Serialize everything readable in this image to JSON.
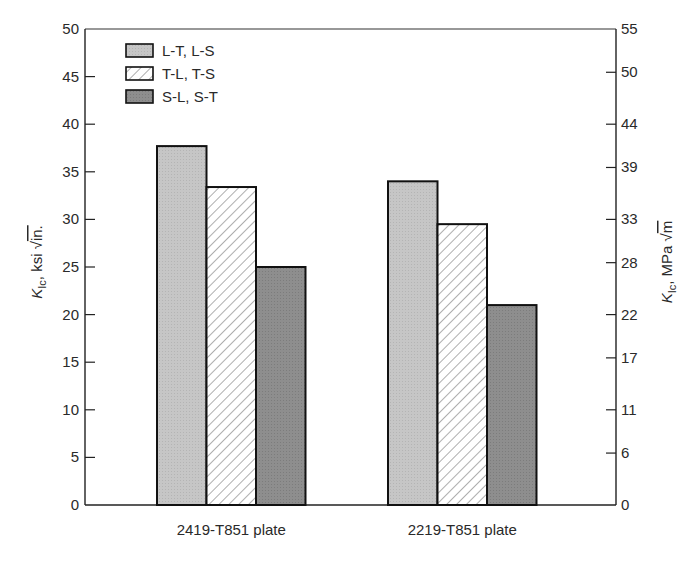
{
  "chart_data": {
    "type": "bar",
    "title": "",
    "categories": [
      "2419-T851 plate",
      "2219-T851 plate"
    ],
    "series": [
      {
        "name": "L-T, L-S",
        "values": [
          37.7,
          34.0
        ],
        "fill": "#c6c6c6",
        "pattern": "solid-light"
      },
      {
        "name": "T-L, T-S",
        "values": [
          33.4,
          29.5
        ],
        "fill": "#ffffff",
        "pattern": "hatch"
      },
      {
        "name": "S-L, S-T",
        "values": [
          25.0,
          21.0
        ],
        "fill": "#8e8e8e",
        "pattern": "solid-dark"
      }
    ],
    "xlabel": "",
    "ylabel": "K_Ic, ksi √in.",
    "ylabel_parts": {
      "main": "K",
      "sub": "Ic",
      "unit": ", ksi ",
      "root": "in."
    },
    "ylim": [
      0,
      50
    ],
    "yticks": [
      0,
      5,
      10,
      15,
      20,
      25,
      30,
      35,
      40,
      45,
      50
    ],
    "y2label": "K_Ic, MPa √m",
    "y2label_parts": {
      "main": "K",
      "sub": "Ic",
      "unit": ", MPa ",
      "root": "m"
    },
    "y2lim": [
      0,
      55
    ],
    "y2ticks": [
      0,
      6,
      11,
      17,
      22,
      28,
      33,
      39,
      44,
      50,
      55
    ],
    "legend_position": "upper-left",
    "grid": false
  },
  "colors": {
    "axis": "#222222",
    "bar_border": "#111111",
    "hatch": "#9a9a9a",
    "light_bar": "#c6c6c6",
    "dark_bar": "#8e8e8e"
  }
}
